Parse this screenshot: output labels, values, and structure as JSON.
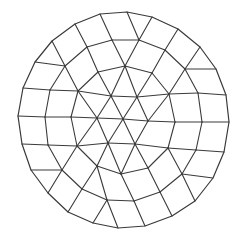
{
  "figure": {
    "width": 238,
    "height": 240,
    "line_color": "#3a3a3a",
    "background": "#ffffff"
  },
  "mesh": {
    "vertices": {
      "C": [
        123,
        119
      ],
      "A0": [
        111,
        96
      ],
      "A1": [
        137,
        97
      ],
      "A2": [
        148,
        121
      ],
      "A3": [
        135,
        144
      ],
      "A4": [
        108,
        143
      ],
      "A5": [
        97,
        118
      ],
      "B0": [
        98,
        72
      ],
      "B1": [
        125,
        66
      ],
      "B2": [
        152,
        73
      ],
      "B3": [
        169,
        94
      ],
      "B4": [
        175,
        122
      ],
      "B5": [
        168,
        148
      ],
      "B6": [
        148,
        168
      ],
      "B7": [
        121,
        174
      ],
      "B8": [
        97,
        166
      ],
      "B9": [
        77,
        146
      ],
      "B10": [
        71,
        117
      ],
      "B11": [
        78,
        91
      ],
      "D0": [
        87,
        47
      ],
      "D1": [
        112,
        40
      ],
      "D2": [
        139,
        40
      ],
      "D3": [
        165,
        50
      ],
      "D4": [
        185,
        69
      ],
      "D5": [
        198,
        93
      ],
      "D6": [
        202,
        122
      ],
      "D7": [
        196,
        150
      ],
      "D8": [
        182,
        174
      ],
      "D9": [
        160,
        192
      ],
      "D10": [
        134,
        201
      ],
      "D11": [
        107,
        200
      ],
      "D12": [
        82,
        189
      ],
      "D13": [
        62,
        170
      ],
      "D14": [
        48,
        145
      ],
      "D15": [
        45,
        117
      ],
      "D16": [
        50,
        90
      ],
      "D17": [
        65,
        66
      ],
      "E0": [
        75,
        24
      ],
      "E1": [
        100,
        14
      ],
      "E2": [
        127,
        12
      ],
      "E3": [
        152,
        17
      ],
      "E4": [
        178,
        29
      ],
      "E5": [
        200,
        47
      ],
      "E6": [
        216,
        69
      ],
      "E7": [
        226,
        95
      ],
      "E8": [
        229,
        122
      ],
      "E9": [
        224,
        152
      ],
      "E10": [
        213,
        178
      ],
      "E11": [
        195,
        201
      ],
      "E12": [
        172,
        216
      ],
      "E13": [
        145,
        226
      ],
      "E14": [
        118,
        228
      ],
      "E15": [
        93,
        223
      ],
      "E16": [
        68,
        212
      ],
      "E17": [
        48,
        193
      ],
      "E18": [
        31,
        170
      ],
      "E19": [
        22,
        144
      ],
      "E20": [
        18,
        116
      ],
      "E21": [
        23,
        88
      ],
      "E22": [
        35,
        62
      ],
      "E23": [
        52,
        41
      ]
    },
    "boundary": [
      "E0",
      "E1",
      "E2",
      "E3",
      "E4",
      "E5",
      "E6",
      "E7",
      "E8",
      "E9",
      "E10",
      "E11",
      "E12",
      "E13",
      "E14",
      "E15",
      "E16",
      "E17",
      "E18",
      "E19",
      "E20",
      "E21",
      "E22",
      "E23"
    ],
    "edges": [
      [
        "C",
        "A0"
      ],
      [
        "C",
        "A1"
      ],
      [
        "C",
        "A2"
      ],
      [
        "C",
        "A3"
      ],
      [
        "C",
        "A4"
      ],
      [
        "C",
        "A5"
      ],
      [
        "A0",
        "A1"
      ],
      [
        "A1",
        "A2"
      ],
      [
        "A2",
        "A3"
      ],
      [
        "A3",
        "A4"
      ],
      [
        "A4",
        "A5"
      ],
      [
        "A5",
        "A0"
      ],
      [
        "A0",
        "B0"
      ],
      [
        "A0",
        "B1"
      ],
      [
        "A1",
        "B1"
      ],
      [
        "A1",
        "B2"
      ],
      [
        "A1",
        "B3"
      ],
      [
        "A2",
        "B3"
      ],
      [
        "A2",
        "B4"
      ],
      [
        "A3",
        "B5"
      ],
      [
        "A3",
        "B6"
      ],
      [
        "A3",
        "B7"
      ],
      [
        "A4",
        "B7"
      ],
      [
        "A4",
        "B8"
      ],
      [
        "A4",
        "B9"
      ],
      [
        "A5",
        "B9"
      ],
      [
        "A5",
        "B10"
      ],
      [
        "A5",
        "B11"
      ],
      [
        "A0",
        "B11"
      ],
      [
        "B0",
        "B1"
      ],
      [
        "B1",
        "B2"
      ],
      [
        "B2",
        "B3"
      ],
      [
        "B3",
        "B4"
      ],
      [
        "B4",
        "B5"
      ],
      [
        "B5",
        "B6"
      ],
      [
        "B6",
        "B7"
      ],
      [
        "B7",
        "B8"
      ],
      [
        "B8",
        "B9"
      ],
      [
        "B9",
        "B10"
      ],
      [
        "B10",
        "B11"
      ],
      [
        "B11",
        "B0"
      ],
      [
        "B0",
        "D0"
      ],
      [
        "B1",
        "D1"
      ],
      [
        "B1",
        "D2"
      ],
      [
        "B2",
        "D3"
      ],
      [
        "B3",
        "D4"
      ],
      [
        "B3",
        "D5"
      ],
      [
        "B4",
        "D6"
      ],
      [
        "B5",
        "D7"
      ],
      [
        "B5",
        "D8"
      ],
      [
        "B6",
        "D9"
      ],
      [
        "B7",
        "D10"
      ],
      [
        "B8",
        "D11"
      ],
      [
        "B8",
        "D12"
      ],
      [
        "B9",
        "D13"
      ],
      [
        "B9",
        "D14"
      ],
      [
        "B10",
        "D15"
      ],
      [
        "B11",
        "D16"
      ],
      [
        "B11",
        "D17"
      ],
      [
        "D0",
        "D1"
      ],
      [
        "D1",
        "D2"
      ],
      [
        "D2",
        "D3"
      ],
      [
        "D3",
        "D4"
      ],
      [
        "D4",
        "D5"
      ],
      [
        "D5",
        "D6"
      ],
      [
        "D6",
        "D7"
      ],
      [
        "D7",
        "D8"
      ],
      [
        "D8",
        "D9"
      ],
      [
        "D9",
        "D10"
      ],
      [
        "D10",
        "D11"
      ],
      [
        "D11",
        "D12"
      ],
      [
        "D12",
        "D13"
      ],
      [
        "D13",
        "D14"
      ],
      [
        "D14",
        "D15"
      ],
      [
        "D15",
        "D16"
      ],
      [
        "D16",
        "D17"
      ],
      [
        "D17",
        "D0"
      ],
      [
        "D0",
        "E0"
      ],
      [
        "D1",
        "E1"
      ],
      [
        "D2",
        "E2"
      ],
      [
        "D2",
        "E3"
      ],
      [
        "D3",
        "E4"
      ],
      [
        "D4",
        "E5"
      ],
      [
        "D4",
        "E6"
      ],
      [
        "D5",
        "E7"
      ],
      [
        "D6",
        "E8"
      ],
      [
        "D7",
        "E9"
      ],
      [
        "D8",
        "E10"
      ],
      [
        "D8",
        "E11"
      ],
      [
        "D9",
        "E12"
      ],
      [
        "D10",
        "E13"
      ],
      [
        "D11",
        "E14"
      ],
      [
        "D11",
        "E15"
      ],
      [
        "D12",
        "E16"
      ],
      [
        "D13",
        "E17"
      ],
      [
        "D13",
        "E18"
      ],
      [
        "D14",
        "E19"
      ],
      [
        "D15",
        "E20"
      ],
      [
        "D16",
        "E21"
      ],
      [
        "D17",
        "E22"
      ],
      [
        "D17",
        "E23"
      ]
    ]
  }
}
